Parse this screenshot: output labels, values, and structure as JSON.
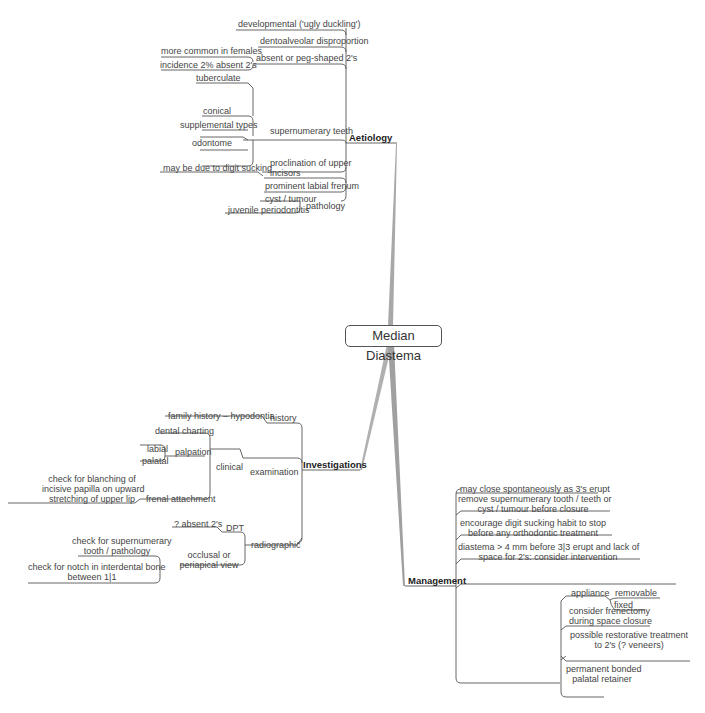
{
  "title": "Median Diastema",
  "branches": {
    "aetiology": {
      "label": "Aetiology",
      "items": {
        "developmental": "developmental ('ugly duckling')",
        "dentoalveolar": "dentoalveolar disproportion",
        "absent_peg": "absent or peg-shaped 2's",
        "absent_peg_children": [
          "more common in females",
          "incidence 2% absent 2's"
        ],
        "supernumerary": "supernumerary teeth",
        "types": "types",
        "types_children": [
          "tuberculate",
          "conical",
          "supplemental",
          "odontome"
        ],
        "proclination_l1": "proclination of upper",
        "proclination_l2": "incisors",
        "proclination_child": "may be due to digit sucking",
        "frenum": "prominent labial frenum",
        "pathology": "pathology",
        "pathology_children": [
          "cyst / tumour",
          "juvenile periodontitis"
        ]
      }
    },
    "investigations": {
      "label": "Investigations",
      "history": "history",
      "history_child": "family history – hypodontia",
      "examination": "examination",
      "clinical": "clinical",
      "clinical_children": {
        "dental_charting": "dental charting",
        "palpation": "palpation",
        "palpation_children": [
          "labial",
          "palatal"
        ],
        "frenal": "frenal attachment",
        "frenal_child": [
          "check for blanching of",
          "incisive papilla on upward",
          "stretching of upper lip"
        ]
      },
      "radiographic": "radiographic",
      "dpt": "DPT",
      "dpt_child": "? absent 2's",
      "occlusal": [
        "occlusal or",
        "periapical view"
      ],
      "occlusal_children": {
        "supernumerary": [
          "check for supernumerary",
          "tooth / pathology"
        ],
        "notch": [
          "check for notch in interdental bone",
          "between 1|1"
        ]
      }
    },
    "management": {
      "label": "Management",
      "items": {
        "spontaneous": "may close spontaneously as 3's erupt",
        "remove": [
          "remove supernumerary tooth / teeth or",
          "cyst / tumour before closure"
        ],
        "digit": [
          "encourage digit sucking habit to stop",
          "before any orthodontic treatment"
        ],
        "diastema": [
          "diastema > 4 mm before 3|3 erupt and lack of",
          "space for 2's: consider intervention"
        ],
        "appliance": "appliance",
        "appliance_children": [
          "removable",
          "fixed"
        ],
        "frenectomy": [
          "consider frenectomy",
          "during space closure"
        ],
        "restorative": [
          "possible restorative treatment",
          "to 2's (? veneers)"
        ],
        "retainer": [
          "permanent bonded",
          "palatal retainer"
        ]
      }
    }
  },
  "colors": {
    "line": "#555555",
    "trunk": "#a8a8a8",
    "text": "#444444"
  }
}
